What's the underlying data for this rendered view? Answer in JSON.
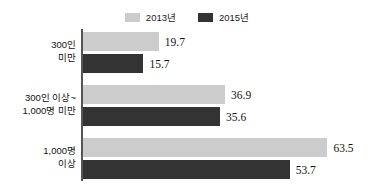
{
  "chart_data": {
    "type": "bar",
    "orientation": "horizontal",
    "title": "",
    "subtitle": "",
    "xlabel": "",
    "ylabel": "",
    "grid": false,
    "legend_position": "top-center",
    "xlim": [
      0,
      63.5
    ],
    "categories": [
      "300인 미만",
      "300인 이상~ 1,000명 미만",
      "1,000명 이상"
    ],
    "category_lines": [
      [
        "300인",
        "미만"
      ],
      [
        "300인 이상~",
        "1,000명 미만"
      ],
      [
        "1,000명",
        "이상"
      ]
    ],
    "series": [
      {
        "name": "2013년",
        "color": "#cccccc",
        "values": [
          19.7,
          36.9,
          63.5
        ],
        "value_labels": [
          "19.7",
          "36.9",
          "63.5"
        ]
      },
      {
        "name": "2015년",
        "color": "#333333",
        "values": [
          15.7,
          35.6,
          53.7
        ],
        "value_labels": [
          "15.7",
          "35.6",
          "53.7"
        ]
      }
    ]
  },
  "legend": {
    "entries": [
      {
        "label": "2013년",
        "color": "#cccccc"
      },
      {
        "label": "2015년",
        "color": "#333333"
      }
    ]
  },
  "axis": {
    "line_color": "#555555"
  },
  "groups": [
    {
      "label_line_1": "300인",
      "label_line_2": "미만",
      "bar_a_value": "19.7",
      "bar_b_value": "15.7"
    },
    {
      "label_line_1": "300인 이상~",
      "label_line_2": "1,000명 미만",
      "bar_a_value": "36.9",
      "bar_b_value": "35.6"
    },
    {
      "label_line_1": "1,000명",
      "label_line_2": "이상",
      "bar_a_value": "63.5",
      "bar_b_value": "53.7"
    }
  ]
}
